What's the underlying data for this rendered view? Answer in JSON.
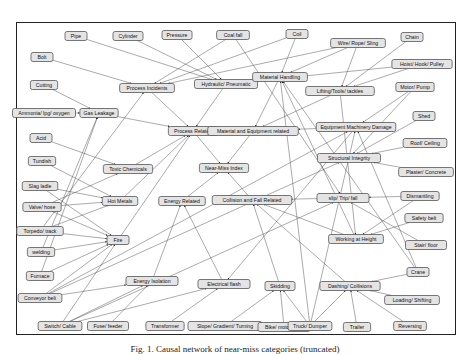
{
  "figure": {
    "caption": "Fig. 1. Causal network of near-miss categories (truncated)"
  },
  "chart_data": {
    "type": "diagram",
    "nodes": [
      {
        "id": "pipe",
        "label": "Pipe",
        "x": 76,
        "y": 36
      },
      {
        "id": "cylinder",
        "label": "Cylinder",
        "x": 128,
        "y": 36
      },
      {
        "id": "pressure",
        "label": "Pressure",
        "x": 177,
        "y": 35
      },
      {
        "id": "coalfall",
        "label": "Coal fall",
        "x": 233,
        "y": 35
      },
      {
        "id": "coil",
        "label": "Coil",
        "x": 297,
        "y": 34
      },
      {
        "id": "wire",
        "label": "Wire/ Rope/ Sling",
        "x": 358,
        "y": 43
      },
      {
        "id": "chain",
        "label": "Chain",
        "x": 412,
        "y": 37
      },
      {
        "id": "bolt",
        "label": "Bolt",
        "x": 42,
        "y": 57
      },
      {
        "id": "hoist",
        "label": "Hoist/ Hook/ Pulley",
        "x": 422,
        "y": 64
      },
      {
        "id": "process_inc",
        "label": "Process Incidents",
        "x": 147,
        "y": 88
      },
      {
        "id": "hydraulic",
        "label": "Hydraulic/ Pneumatic",
        "x": 226,
        "y": 84
      },
      {
        "id": "material_h",
        "label": "Material Handling",
        "x": 280,
        "y": 77
      },
      {
        "id": "lifting",
        "label": "Lifting/Tools/ tackles",
        "x": 340,
        "y": 91
      },
      {
        "id": "motor",
        "label": "Motor/ Pump",
        "x": 415,
        "y": 87
      },
      {
        "id": "cutting",
        "label": "Cutting",
        "x": 44,
        "y": 85
      },
      {
        "id": "ammonia",
        "label": "Ammonia/ lpg/ oxygen",
        "x": 44,
        "y": 113
      },
      {
        "id": "gas",
        "label": "Gas Leakage",
        "x": 99,
        "y": 113
      },
      {
        "id": "shed",
        "label": "Shed",
        "x": 424,
        "y": 116
      },
      {
        "id": "process_rel",
        "label": "Process Related",
        "x": 193,
        "y": 131
      },
      {
        "id": "mat_eq",
        "label": "Material and Equipment related",
        "x": 253,
        "y": 131
      },
      {
        "id": "eq_dmg",
        "label": "Equipment Machinery Damage",
        "x": 356,
        "y": 127
      },
      {
        "id": "acid",
        "label": "Acid",
        "x": 41,
        "y": 138
      },
      {
        "id": "tundish",
        "label": "Tundish",
        "x": 42,
        "y": 161
      },
      {
        "id": "toxic",
        "label": "Toxic Chemicals",
        "x": 128,
        "y": 169
      },
      {
        "id": "nearmiss",
        "label": "Near-Miss Index",
        "x": 224,
        "y": 168
      },
      {
        "id": "roof",
        "label": "Roof/ Ceiling",
        "x": 425,
        "y": 143
      },
      {
        "id": "structural",
        "label": "Structural Integrity",
        "x": 349,
        "y": 158
      },
      {
        "id": "plaster",
        "label": "Plaster/ Concrete",
        "x": 426,
        "y": 172
      },
      {
        "id": "slag",
        "label": "Slag ladle",
        "x": 40,
        "y": 186
      },
      {
        "id": "valve",
        "label": "Valve/ hose",
        "x": 42,
        "y": 207
      },
      {
        "id": "hot",
        "label": "Hot Metals",
        "x": 120,
        "y": 201
      },
      {
        "id": "energy_rel",
        "label": "Energy Related",
        "x": 182,
        "y": 201
      },
      {
        "id": "collision_fall",
        "label": "Collision and Fall Related",
        "x": 252,
        "y": 200
      },
      {
        "id": "slip",
        "label": "slip/ Trip/ fall",
        "x": 343,
        "y": 198
      },
      {
        "id": "dismantling",
        "label": "Dismantling",
        "x": 420,
        "y": 196
      },
      {
        "id": "torpedo",
        "label": "Torpedo/ track",
        "x": 40,
        "y": 231
      },
      {
        "id": "fire",
        "label": "Fire",
        "x": 118,
        "y": 240
      },
      {
        "id": "safety_belt",
        "label": "Safety belt",
        "x": 424,
        "y": 218
      },
      {
        "id": "working_h",
        "label": "Working at Height",
        "x": 356,
        "y": 239
      },
      {
        "id": "welding",
        "label": "welding",
        "x": 41,
        "y": 252
      },
      {
        "id": "stair",
        "label": "Stair/ floor",
        "x": 426,
        "y": 245
      },
      {
        "id": "furnace",
        "label": "Furnace",
        "x": 40,
        "y": 276
      },
      {
        "id": "crane",
        "label": "Crane",
        "x": 418,
        "y": 272
      },
      {
        "id": "energy_iso",
        "label": "Energy Isolation",
        "x": 152,
        "y": 281
      },
      {
        "id": "electrical",
        "label": "Electrical flash",
        "x": 224,
        "y": 284
      },
      {
        "id": "skidding",
        "label": "Skidding",
        "x": 280,
        "y": 286
      },
      {
        "id": "dashing",
        "label": "Dashing/ Collisions",
        "x": 350,
        "y": 286
      },
      {
        "id": "conveyor",
        "label": "Conveyor belt",
        "x": 40,
        "y": 298
      },
      {
        "id": "loading",
        "label": "Loading/ Shifting",
        "x": 412,
        "y": 300
      },
      {
        "id": "switch",
        "label": "Switch/ Cable",
        "x": 60,
        "y": 326
      },
      {
        "id": "fuse",
        "label": "Fuse/ feeder",
        "x": 108,
        "y": 326
      },
      {
        "id": "transformer",
        "label": "Transformer",
        "x": 165,
        "y": 326
      },
      {
        "id": "slope",
        "label": "Slope/ Gradient/ Turning",
        "x": 225,
        "y": 326
      },
      {
        "id": "bike",
        "label": "Bike/ motorcycle",
        "x": 284,
        "y": 327
      },
      {
        "id": "truck",
        "label": "Truck/ Dumper",
        "x": 310,
        "y": 326
      },
      {
        "id": "trailer",
        "label": "Trailer",
        "x": 357,
        "y": 327
      },
      {
        "id": "reversing",
        "label": "Reversing",
        "x": 410,
        "y": 326
      }
    ],
    "edges": [
      [
        "pipe",
        "hydraulic"
      ],
      [
        "cylinder",
        "hydraulic"
      ],
      [
        "pressure",
        "hydraulic"
      ],
      [
        "coalfall",
        "process_inc"
      ],
      [
        "coil",
        "process_inc"
      ],
      [
        "coil",
        "material_h"
      ],
      [
        "bolt",
        "process_inc"
      ],
      [
        "wire",
        "material_h"
      ],
      [
        "wire",
        "lifting"
      ],
      [
        "wire",
        "process_inc"
      ],
      [
        "chain",
        "lifting"
      ],
      [
        "hoist",
        "lifting"
      ],
      [
        "hoist",
        "hydraulic"
      ],
      [
        "cutting",
        "gas"
      ],
      [
        "ammonia",
        "gas"
      ],
      [
        "gas",
        "process_rel"
      ],
      [
        "process_inc",
        "process_rel"
      ],
      [
        "hydraulic",
        "process_rel"
      ],
      [
        "material_h",
        "mat_eq"
      ],
      [
        "lifting",
        "mat_eq"
      ],
      [
        "eq_dmg",
        "mat_eq"
      ],
      [
        "motor",
        "eq_dmg"
      ],
      [
        "shed",
        "structural"
      ],
      [
        "roof",
        "structural"
      ],
      [
        "plaster",
        "structural"
      ],
      [
        "process_rel",
        "nearmiss"
      ],
      [
        "mat_eq",
        "nearmiss"
      ],
      [
        "energy_rel",
        "nearmiss"
      ],
      [
        "collision_fall",
        "nearmiss"
      ],
      [
        "acid",
        "toxic"
      ],
      [
        "tundish",
        "hot"
      ],
      [
        "slag",
        "hot"
      ],
      [
        "valve",
        "hot"
      ],
      [
        "valve",
        "toxic"
      ],
      [
        "torpedo",
        "hot"
      ],
      [
        "toxic",
        "process_rel"
      ],
      [
        "hot",
        "process_rel"
      ],
      [
        "welding",
        "fire"
      ],
      [
        "furnace",
        "fire"
      ],
      [
        "conveyor",
        "fire"
      ],
      [
        "slag",
        "fire"
      ],
      [
        "valve",
        "fire"
      ],
      [
        "torpedo",
        "fire"
      ],
      [
        "fire",
        "process_rel"
      ],
      [
        "conveyor",
        "energy_iso"
      ],
      [
        "switch",
        "energy_iso"
      ],
      [
        "fuse",
        "energy_iso"
      ],
      [
        "switch",
        "fire"
      ],
      [
        "switch",
        "electrical"
      ],
      [
        "transformer",
        "electrical"
      ],
      [
        "energy_iso",
        "energy_rel"
      ],
      [
        "electrical",
        "energy_rel"
      ],
      [
        "slip",
        "collision_fall"
      ],
      [
        "working_h",
        "collision_fall"
      ],
      [
        "dashing",
        "collision_fall"
      ],
      [
        "skidding",
        "collision_fall"
      ],
      [
        "dismantling",
        "working_h"
      ],
      [
        "safety_belt",
        "working_h"
      ],
      [
        "stair",
        "slip"
      ],
      [
        "crane",
        "dashing"
      ],
      [
        "loading",
        "dashing"
      ],
      [
        "reversing",
        "dashing"
      ],
      [
        "trailer",
        "dashing"
      ],
      [
        "truck",
        "dashing"
      ],
      [
        "slope",
        "skidding"
      ],
      [
        "bike",
        "skidding"
      ],
      [
        "truck",
        "skidding"
      ],
      [
        "crane",
        "material_h"
      ],
      [
        "crane",
        "eq_dmg"
      ],
      [
        "truck",
        "material_h"
      ],
      [
        "conveyor",
        "eq_dmg"
      ],
      [
        "switch",
        "slip"
      ],
      [
        "motor",
        "structural"
      ],
      [
        "working_h",
        "material_h"
      ],
      [
        "furnace",
        "gas"
      ],
      [
        "welding",
        "gas"
      ],
      [
        "torpedo",
        "process_inc"
      ],
      [
        "conveyor",
        "structural"
      ],
      [
        "coalfall",
        "slip"
      ],
      [
        "truck",
        "eq_dmg"
      ],
      [
        "dismantling",
        "slip"
      ],
      [
        "eq_dmg",
        "electrical"
      ],
      [
        "lifting",
        "working_h"
      ]
    ]
  }
}
